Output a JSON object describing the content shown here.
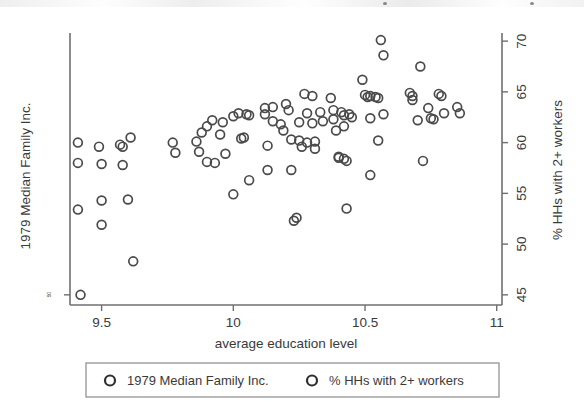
{
  "figure": {
    "background_color": "#ffffff",
    "marker_color": "#4a4a4a",
    "axis_color": "#6f6f6f",
    "text_color": "#3a3a3a"
  },
  "chart_data": {
    "type": "scatter",
    "title": "",
    "xlabel": "average education level",
    "ylabel_left": "1979 Median Family Inc.",
    "ylabel_right": "% HHs with 2+ workers",
    "xlim": [
      9.38,
      11.02
    ],
    "ylim_right": [
      44.0,
      70.8
    ],
    "xticks": [
      9.5,
      10,
      10.5,
      11
    ],
    "xticklabels": [
      "9.5",
      "10",
      "10.5",
      "11"
    ],
    "yticks_right": [
      45,
      50,
      55,
      60,
      65,
      70
    ],
    "yticklabels_right": [
      "45",
      "50",
      "55",
      "60",
      "65",
      "70"
    ],
    "yticks_left": [
      45
    ],
    "yticklabels_left": [
      "50"
    ],
    "grid": false,
    "legend_position": "below-axes",
    "legend": [
      {
        "label": "1979 Median Family Inc.",
        "marker": "open-circle"
      },
      {
        "label": "% HHs with 2+ workers",
        "marker": "open-circle"
      }
    ],
    "series": [
      {
        "name": "% HHs with 2+ workers",
        "marker": "open-circle",
        "points": [
          [
            9.42,
            45.0
          ],
          [
            9.41,
            60.0
          ],
          [
            9.41,
            58.0
          ],
          [
            9.41,
            53.4
          ],
          [
            9.49,
            59.6
          ],
          [
            9.5,
            57.9
          ],
          [
            9.5,
            54.3
          ],
          [
            9.5,
            51.9
          ],
          [
            9.57,
            59.8
          ],
          [
            9.58,
            59.6
          ],
          [
            9.58,
            57.8
          ],
          [
            9.6,
            54.4
          ],
          [
            9.61,
            60.5
          ],
          [
            9.62,
            48.3
          ],
          [
            9.77,
            60.0
          ],
          [
            9.78,
            59.0
          ],
          [
            9.86,
            60.1
          ],
          [
            9.88,
            61.0
          ],
          [
            9.87,
            59.1
          ],
          [
            9.9,
            61.6
          ],
          [
            9.9,
            58.1
          ],
          [
            9.92,
            62.2
          ],
          [
            9.93,
            58.0
          ],
          [
            9.95,
            60.8
          ],
          [
            9.96,
            62.0
          ],
          [
            9.97,
            58.9
          ],
          [
            10.0,
            62.6
          ],
          [
            10.0,
            54.9
          ],
          [
            10.02,
            62.9
          ],
          [
            10.03,
            60.4
          ],
          [
            10.04,
            60.5
          ],
          [
            10.05,
            62.8
          ],
          [
            10.06,
            62.7
          ],
          [
            10.06,
            56.3
          ],
          [
            10.12,
            63.4
          ],
          [
            10.12,
            62.8
          ],
          [
            10.13,
            59.7
          ],
          [
            10.13,
            57.3
          ],
          [
            10.15,
            63.5
          ],
          [
            10.15,
            62.1
          ],
          [
            10.18,
            61.8
          ],
          [
            10.19,
            61.2
          ],
          [
            10.2,
            63.8
          ],
          [
            10.21,
            63.2
          ],
          [
            10.22,
            60.3
          ],
          [
            10.22,
            57.3
          ],
          [
            10.23,
            52.3
          ],
          [
            10.24,
            52.6
          ],
          [
            10.25,
            62.0
          ],
          [
            10.25,
            60.2
          ],
          [
            10.26,
            59.6
          ],
          [
            10.27,
            64.8
          ],
          [
            10.28,
            62.9
          ],
          [
            10.28,
            60.0
          ],
          [
            10.3,
            64.6
          ],
          [
            10.3,
            61.9
          ],
          [
            10.31,
            60.1
          ],
          [
            10.31,
            59.4
          ],
          [
            10.33,
            63.0
          ],
          [
            10.34,
            62.1
          ],
          [
            10.37,
            64.4
          ],
          [
            10.38,
            63.2
          ],
          [
            10.38,
            62.3
          ],
          [
            10.39,
            61.2
          ],
          [
            10.4,
            58.6
          ],
          [
            10.4,
            58.5
          ],
          [
            10.41,
            63.0
          ],
          [
            10.42,
            62.7
          ],
          [
            10.42,
            61.6
          ],
          [
            10.42,
            58.4
          ],
          [
            10.43,
            58.2
          ],
          [
            10.43,
            53.5
          ],
          [
            10.44,
            62.8
          ],
          [
            10.45,
            62.5
          ],
          [
            10.49,
            66.2
          ],
          [
            10.5,
            64.7
          ],
          [
            10.51,
            64.5
          ],
          [
            10.52,
            64.6
          ],
          [
            10.52,
            62.4
          ],
          [
            10.52,
            56.8
          ],
          [
            10.54,
            64.5
          ],
          [
            10.55,
            64.4
          ],
          [
            10.55,
            60.2
          ],
          [
            10.56,
            70.1
          ],
          [
            10.57,
            68.6
          ],
          [
            10.57,
            62.8
          ],
          [
            10.67,
            64.9
          ],
          [
            10.68,
            64.2
          ],
          [
            10.68,
            64.6
          ],
          [
            10.7,
            62.2
          ],
          [
            10.71,
            67.5
          ],
          [
            10.72,
            58.2
          ],
          [
            10.74,
            63.4
          ],
          [
            10.75,
            62.4
          ],
          [
            10.76,
            62.3
          ],
          [
            10.78,
            64.8
          ],
          [
            10.79,
            64.6
          ],
          [
            10.8,
            62.9
          ],
          [
            10.85,
            63.5
          ],
          [
            10.86,
            62.9
          ]
        ]
      }
    ]
  }
}
